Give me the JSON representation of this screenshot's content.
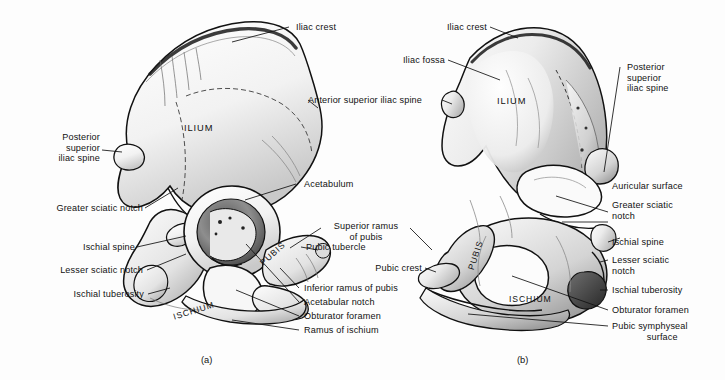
{
  "figure": {
    "background": "#fdfdfd",
    "ink": "#111111"
  },
  "panels": [
    {
      "id": "a",
      "caption": "(a)",
      "view": "lateral (external) surface of right hip bone",
      "bone_regions": [
        {
          "name": "ILIUM",
          "label": "ILIUM"
        },
        {
          "name": "PUBIS",
          "label": "PUBIS"
        },
        {
          "name": "ISCHIUM",
          "label": "ISCHIUM"
        }
      ],
      "labels": [
        {
          "id": "a-iliac-crest",
          "text": "Iliac crest",
          "align": "left"
        },
        {
          "id": "a-anterior-superior-iliac-spine",
          "text": "Anterior superior iliac spine",
          "align": "left"
        },
        {
          "id": "a-posterior-superior-iliac-spine",
          "text": "Posterior\nsuperior\niliac spine",
          "align": "right"
        },
        {
          "id": "a-acetabulum",
          "text": "Acetabulum",
          "align": "left"
        },
        {
          "id": "a-greater-sciatic-notch",
          "text": "Greater sciatic notch",
          "align": "right"
        },
        {
          "id": "a-ischial-spine",
          "text": "Ischial spine",
          "align": "right"
        },
        {
          "id": "a-lesser-sciatic-notch",
          "text": "Lesser sciatic notch",
          "align": "right"
        },
        {
          "id": "a-ischial-tuberosity",
          "text": "Ischial tuberosity",
          "align": "right"
        },
        {
          "id": "a-superior-ramus-of-pubis",
          "text": "Superior ramus\nof pubis",
          "align": "center"
        },
        {
          "id": "a-pubic-tubercle",
          "text": "Pubic tubercle",
          "align": "left"
        },
        {
          "id": "a-inferior-ramus-of-pubis",
          "text": "Inferior ramus of pubis",
          "align": "left"
        },
        {
          "id": "a-acetabular-notch",
          "text": "Acetabular notch",
          "align": "left"
        },
        {
          "id": "a-obturator-foramen",
          "text": "Obturator foramen",
          "align": "left"
        },
        {
          "id": "a-ramus-of-ischium",
          "text": "Ramus of ischium",
          "align": "left"
        }
      ]
    },
    {
      "id": "b",
      "caption": "(b)",
      "view": "medial (internal) surface of right hip bone",
      "bone_regions": [
        {
          "name": "ILIUM",
          "label": "ILIUM"
        },
        {
          "name": "PUBIS",
          "label": "PUBIS"
        },
        {
          "name": "ISCHIUM",
          "label": "ISCHIUM"
        }
      ],
      "labels": [
        {
          "id": "b-iliac-crest",
          "text": "Iliac crest",
          "align": "right"
        },
        {
          "id": "b-iliac-fossa",
          "text": "Iliac fossa",
          "align": "right"
        },
        {
          "id": "b-anterior-superior-iliac-spine",
          "text": "Anterior superior iliac spine",
          "align": "right"
        },
        {
          "id": "b-posterior-superior-iliac-spine",
          "text": "Posterior\nsuperior\niliac spine",
          "align": "left"
        },
        {
          "id": "b-auricular-surface",
          "text": "Auricular surface",
          "align": "left"
        },
        {
          "id": "b-greater-sciatic-notch",
          "text": "Greater sciatic\nnotch",
          "align": "left"
        },
        {
          "id": "b-ischial-spine",
          "text": "Ischial spine",
          "align": "left"
        },
        {
          "id": "b-lesser-sciatic-notch",
          "text": "Lesser sciatic\nnotch",
          "align": "left"
        },
        {
          "id": "b-ischial-tuberosity",
          "text": "Ischial tuberosity",
          "align": "left"
        },
        {
          "id": "b-obturator-foramen",
          "text": "Obturator foramen",
          "align": "left"
        },
        {
          "id": "b-pubic-symphyseal-surface",
          "text": "Pubic symphyseal\n             surface",
          "align": "left"
        },
        {
          "id": "b-pubic-crest",
          "text": "Pubic crest",
          "align": "right"
        }
      ]
    }
  ]
}
